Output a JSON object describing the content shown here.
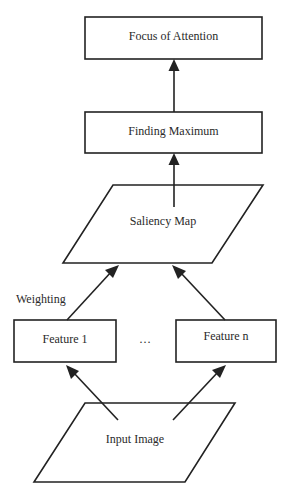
{
  "diagram": {
    "nodes": {
      "focus": "Focus of Attention",
      "maximum": "Finding Maximum",
      "saliency": "Saliency Map",
      "feature1": "Feature 1",
      "featuren": "Feature n",
      "input": "Input Image"
    },
    "ellipsis": "…",
    "edge_label": "Weighting",
    "edges": [
      {
        "from": "input",
        "to": "feature1"
      },
      {
        "from": "input",
        "to": "featuren"
      },
      {
        "from": "feature1",
        "to": "saliency",
        "label": "Weighting"
      },
      {
        "from": "featuren",
        "to": "saliency"
      },
      {
        "from": "saliency",
        "to": "maximum"
      },
      {
        "from": "maximum",
        "to": "focus"
      }
    ]
  }
}
